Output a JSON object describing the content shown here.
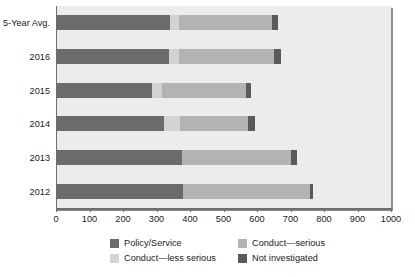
{
  "chart_data": {
    "type": "bar",
    "orientation": "horizontal",
    "stacked": true,
    "title": "",
    "xlabel": "",
    "ylabel": "",
    "xlim": [
      0,
      1000
    ],
    "xticks": [
      0,
      100,
      200,
      300,
      400,
      500,
      600,
      700,
      800,
      900,
      1000
    ],
    "xtick_labels": [
      "0",
      "100",
      "200",
      "300",
      "400",
      "500",
      "600",
      "700",
      "800",
      "900",
      "1000"
    ],
    "grid": false,
    "legend_position": "bottom",
    "categories": [
      "5-Year Avg.",
      "2016",
      "2015",
      "2014",
      "2013",
      "2012"
    ],
    "series": [
      {
        "name": "Policy/Service",
        "color": "#6b6b6b",
        "values": [
          340,
          337,
          287,
          322,
          376,
          379
        ]
      },
      {
        "name": "Conduct—less serious",
        "color": "#d3d3d3",
        "values": [
          28,
          30,
          30,
          48,
          0,
          0
        ]
      },
      {
        "name": "Conduct—serious",
        "color": "#b3b3b3",
        "values": [
          277,
          284,
          249,
          203,
          325,
          379
        ]
      },
      {
        "name": "Not investigated",
        "color": "#5a5a5a",
        "values": [
          18,
          22,
          16,
          22,
          18,
          9
        ]
      }
    ],
    "totals": [
      663,
      673,
      582,
      595,
      719,
      767
    ],
    "legend_entries": [
      {
        "label": "Policy/Service",
        "color": "#6b6b6b"
      },
      {
        "label": "Conduct—serious",
        "color": "#b3b3b3"
      },
      {
        "label": "Conduct—less serious",
        "color": "#d3d3d3"
      },
      {
        "label": "Not investigated",
        "color": "#5a5a5a"
      }
    ]
  },
  "colors": {
    "plot_background": "#ececed",
    "axis": "#6e6e6e",
    "text": "#1b1b1b",
    "page_background": "#ffffff"
  }
}
